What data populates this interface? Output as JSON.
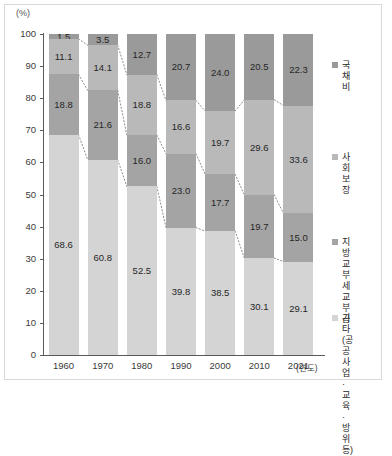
{
  "axis": {
    "unit_label": "(%)",
    "y_ticks": [
      "100",
      "90",
      "80",
      "70",
      "60",
      "50",
      "40",
      "30",
      "20",
      "10",
      "0"
    ],
    "x_unit_label": "(연도)"
  },
  "legend": {
    "items": [
      {
        "label": "국채비",
        "color": "#9a9a9a",
        "key": "debt"
      },
      {
        "label": "사회보장",
        "color": "#b9b9b9",
        "key": "social"
      },
      {
        "label": "지방교부세\n교부금",
        "color": "#a4a4a4",
        "key": "local"
      },
      {
        "label": "기타(공공사업 ·\n교육 · 방위 등)",
        "color": "#d4d4d4",
        "key": "other"
      }
    ]
  },
  "chart_data": {
    "type": "bar",
    "title": "",
    "subtitle": "",
    "xlabel": "(연도)",
    "ylabel": "(%)",
    "ylim": [
      0,
      100
    ],
    "grid": false,
    "stacked": true,
    "stack_order_top_to_bottom": [
      "국채비",
      "사회보장",
      "지방교부세 교부금",
      "기타(공공사업 · 교육 · 방위 등)"
    ],
    "legend_position": "right",
    "categories": [
      "1960",
      "1970",
      "1980",
      "1990",
      "2000",
      "2010",
      "2021"
    ],
    "series": [
      {
        "name": "국채비",
        "color": "#9a9a9a",
        "values": [
          1.5,
          3.5,
          12.7,
          20.7,
          24.0,
          20.5,
          22.3
        ]
      },
      {
        "name": "사회보장",
        "color": "#b9b9b9",
        "values": [
          11.1,
          14.1,
          18.8,
          16.6,
          19.7,
          29.6,
          33.6
        ]
      },
      {
        "name": "지방교부세 교부금",
        "color": "#a4a4a4",
        "values": [
          18.8,
          21.6,
          16.0,
          23.0,
          17.7,
          19.7,
          15.0
        ]
      },
      {
        "name": "기타(공공사업 · 교육 · 방위 등)",
        "color": "#d4d4d4",
        "values": [
          68.6,
          60.8,
          52.5,
          39.8,
          38.5,
          30.1,
          29.1
        ]
      }
    ],
    "data_labels": {
      "1960": {
        "국채비": "1.5",
        "사회보장": "11.1",
        "지방교부세 교부금": "18.8",
        "기타": "68.6"
      },
      "1970": {
        "국채비": "3.5",
        "사회보장": "14.1",
        "지방교부세 교부금": "21.6",
        "기타": "60.8"
      },
      "1980": {
        "국채비": "12.7",
        "사회보장": "18.8",
        "지방교부세 교부금": "16.0",
        "기타": "52.5"
      },
      "1990": {
        "국채비": "20.7",
        "사회보장": "16.6",
        "지방교부세 교부금": "23.0",
        "기타": "39.8"
      },
      "2000": {
        "국채비": "24.0",
        "사회보장": "19.7",
        "지방교부세 교부금": "17.7",
        "기타": "38.5"
      },
      "2010": {
        "국채비": "20.5",
        "사회보장": "29.6",
        "지방교부세 교부금": "19.7",
        "기타": "30.1"
      },
      "2021": {
        "국채비": "22.3",
        "사회보장": "33.6",
        "지방교부세 교부금": "15.0",
        "기타": "29.1"
      }
    }
  }
}
